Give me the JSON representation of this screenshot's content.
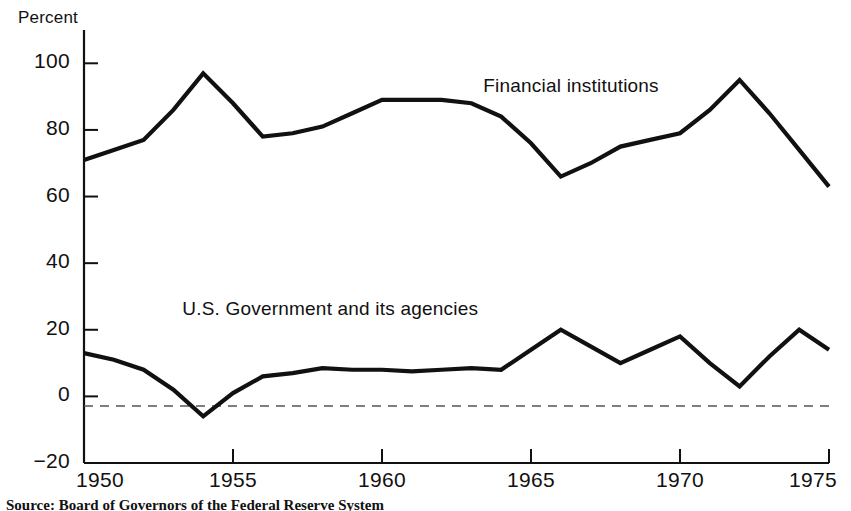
{
  "chart_data": {
    "type": "line",
    "title": "",
    "xlabel": "",
    "ylabel": "Percent",
    "ylim": [
      -20,
      110
    ],
    "xlim": [
      1950,
      1975
    ],
    "yticks": [
      -20,
      0,
      20,
      40,
      60,
      80,
      100
    ],
    "ytick_labels": [
      "−20",
      "0",
      "20",
      "40",
      "60",
      "80",
      "100"
    ],
    "xticks": [
      1950,
      1955,
      1960,
      1965,
      1970,
      1975
    ],
    "xtick_labels": [
      "1950",
      "1955",
      "1960",
      "1965",
      "1970",
      "1975"
    ],
    "grid": false,
    "zero_line": true,
    "zero_line_style": "dashed",
    "legend_position": "inline-annotations",
    "x": [
      1950,
      1951,
      1952,
      1953,
      1954,
      1955,
      1956,
      1957,
      1958,
      1959,
      1960,
      1961,
      1962,
      1963,
      1964,
      1965,
      1966,
      1967,
      1968,
      1969,
      1970,
      1971,
      1972,
      1973,
      1974,
      1975
    ],
    "series": [
      {
        "name": "Financial institutions",
        "label_x": 1963.4,
        "label_y": 93,
        "values": [
          71,
          74,
          77,
          86,
          97,
          88,
          78,
          79,
          81,
          85,
          89,
          89,
          89,
          88,
          84,
          76,
          66,
          70,
          75,
          77,
          79,
          86,
          95,
          85,
          74,
          63
        ]
      },
      {
        "name": "U.S. Government and its agencies",
        "label_x": 1953.3,
        "label_y": 26,
        "values": [
          13,
          11,
          8,
          2,
          -6,
          1,
          6,
          7,
          8.5,
          8,
          8,
          7.5,
          8,
          8.5,
          8,
          14,
          20,
          15,
          10,
          14,
          18,
          10,
          3,
          12,
          20,
          14
        ]
      }
    ]
  },
  "axis": {
    "ylabel": "Percent"
  },
  "source": {
    "text": "Source: Board of Governors of the Federal Reserve System"
  }
}
